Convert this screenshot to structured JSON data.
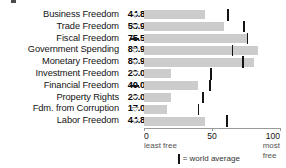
{
  "chart_data": {
    "type": "bar",
    "title": "",
    "xlabel": "",
    "ylabel": "",
    "orientation": "horizontal",
    "xlim": [
      0,
      100
    ],
    "grid": false,
    "categories": [
      "Business Freedom",
      "Trade Freedom",
      "Fiscal Freedom",
      "Government Spending",
      "Monetary Freedom",
      "Investment Freedom",
      "Financial Freedom",
      "Property Rights",
      "Fdm. from Corruption",
      "Labor Freedom"
    ],
    "values": [
      44.8,
      58.9,
      75.5,
      83.9,
      80.9,
      20.0,
      40.0,
      20.0,
      17.0,
      44.8
    ],
    "value_labels": [
      "44.8",
      "58.9",
      "75.5",
      "83.9",
      "80.9",
      "20.0",
      "40.0",
      "20.0",
      "17.0",
      "44.8"
    ],
    "trend_markers": [
      "down",
      "down",
      "flat",
      "down",
      "down",
      "down",
      "flat",
      "down",
      "down",
      "down"
    ],
    "world_average": [
      62.0,
      73.5,
      76.0,
      65.0,
      73.0,
      49.5,
      48.5,
      43.5,
      40.0,
      61.0
    ],
    "axis_ticks": [
      {
        "value": 0,
        "label": "0"
      },
      {
        "value": 50,
        "label": "50"
      },
      {
        "value": 100,
        "label": "100"
      }
    ],
    "axis_end_labels": {
      "left": "least free",
      "right": "most free"
    },
    "legend": {
      "marker_label": "= world average",
      "position": "bottom-center"
    },
    "colors": {
      "bar": "#cccccc",
      "average_tick": "#141414",
      "marker_down": "#9a9a9a",
      "marker_flat": "#1a1a1a",
      "axis": "#9a9a9a"
    }
  }
}
